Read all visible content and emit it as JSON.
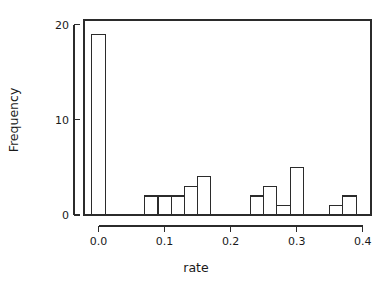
{
  "chart_data": {
    "type": "bar",
    "subtype": "histogram",
    "title": "",
    "subtitle": "",
    "xlabel": "rate",
    "ylabel": "Frequency",
    "xlim": [
      -0.022,
      0.4125
    ],
    "ylim": [
      0,
      20.5
    ],
    "xticks": [
      0.0,
      0.1,
      0.2,
      0.3,
      0.4
    ],
    "xtick_labels": [
      "0.0",
      "0.1",
      "0.2",
      "0.3",
      "0.4"
    ],
    "yticks": [
      0,
      10,
      20
    ],
    "ytick_labels": [
      "0",
      "10",
      "20"
    ],
    "grid": false,
    "legend": null,
    "bin_width": 0.02,
    "bar_fill_color": "#ffffff",
    "bar_edge_color": "#2b2b2b",
    "axis_color": "#2b2b2b",
    "bins": [
      {
        "left": -0.01,
        "right": 0.01,
        "count": 19
      },
      {
        "left": 0.07,
        "right": 0.09,
        "count": 2
      },
      {
        "left": 0.09,
        "right": 0.11,
        "count": 2
      },
      {
        "left": 0.11,
        "right": 0.13,
        "count": 2
      },
      {
        "left": 0.13,
        "right": 0.15,
        "count": 3
      },
      {
        "left": 0.15,
        "right": 0.17,
        "count": 4
      },
      {
        "left": 0.23,
        "right": 0.25,
        "count": 2
      },
      {
        "left": 0.25,
        "right": 0.27,
        "count": 3
      },
      {
        "left": 0.27,
        "right": 0.29,
        "count": 1
      },
      {
        "left": 0.29,
        "right": 0.31,
        "count": 5
      },
      {
        "left": 0.35,
        "right": 0.37,
        "count": 1
      },
      {
        "left": 0.37,
        "right": 0.39,
        "count": 2
      }
    ],
    "categories": [
      "-0.01",
      "0.07",
      "0.09",
      "0.11",
      "0.13",
      "0.15",
      "0.23",
      "0.25",
      "0.27",
      "0.29",
      "0.35",
      "0.37"
    ],
    "values": [
      19,
      2,
      2,
      2,
      3,
      4,
      2,
      3,
      1,
      5,
      1,
      2
    ]
  }
}
